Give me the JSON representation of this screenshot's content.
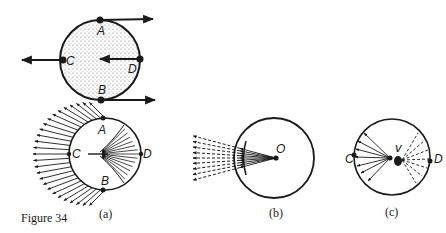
{
  "figure": {
    "caption": "Figure 34",
    "ink_color": "#1a1a1a",
    "background": "#ffffff"
  },
  "top_diagram": {
    "points": {
      "A": "A",
      "B": "B",
      "C": "C",
      "D": "D"
    },
    "description": "Stippled disc with velocity arrows: A and B point right, C points left, D points left toward centre"
  },
  "panels": [
    {
      "id": "a",
      "label": "(a)",
      "points": {
        "A": "A",
        "B": "B",
        "C": "C",
        "D": "D"
      }
    },
    {
      "id": "b",
      "label": "(b)",
      "points": {
        "O": "O"
      }
    },
    {
      "id": "c",
      "label": "(c)",
      "points": {
        "C": "C",
        "D": "D",
        "v": "v"
      }
    }
  ]
}
